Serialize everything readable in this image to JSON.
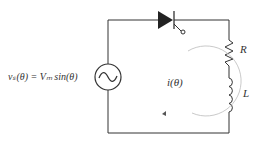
{
  "diagram": {
    "source_label": "vₛ(θ) = Vₘ sin(θ)",
    "current_label": "i(θ)",
    "resistor_label": "R",
    "inductor_label": "L",
    "components": [
      "ac-voltage-source",
      "thyristor",
      "resistor",
      "inductor"
    ],
    "wire_color": "#333333"
  }
}
